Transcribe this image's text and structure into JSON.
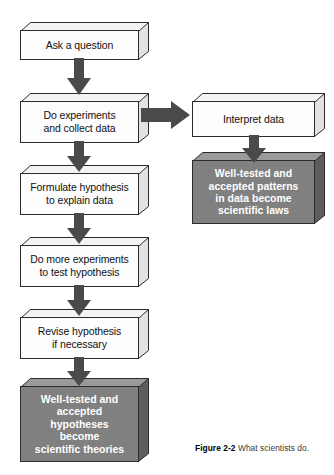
{
  "figure": {
    "caption_number": "Figure 2-2",
    "caption_text": "What scientists do.",
    "colors": {
      "box_fill": "#fdfdfd",
      "box_stroke": "#2b2b2b",
      "conclusion_fill": "#808080",
      "conclusion_top": "#9a9a9a",
      "conclusion_side": "#5e5e5e",
      "arrow_fill": "#4a4a4a",
      "text": "#111111",
      "conclusion_text": "#ffffff"
    }
  },
  "nodes": {
    "ask_question": {
      "lines": [
        "Ask a question"
      ],
      "type": "process"
    },
    "do_experiments": {
      "lines": [
        "Do experiments",
        "and collect data"
      ],
      "type": "process"
    },
    "interpret_data": {
      "lines": [
        "Interpret data"
      ],
      "type": "process"
    },
    "scientific_laws": {
      "lines": [
        "Well-tested and",
        "accepted patterns",
        "in data become"
      ],
      "emphasis": "scientific laws",
      "type": "conclusion"
    },
    "formulate_hypothesis": {
      "lines": [
        "Formulate hypothesis",
        "to explain data"
      ],
      "type": "process"
    },
    "more_experiments": {
      "lines": [
        "Do more experiments",
        "to test hypothesis"
      ],
      "type": "process"
    },
    "revise_hypothesis": {
      "lines": [
        "Revise hypothesis",
        "if necessary"
      ],
      "type": "process"
    },
    "scientific_theories": {
      "lines": [
        "Well-tested and",
        "accepted",
        "hypotheses",
        "become"
      ],
      "emphasis": "scientific theories",
      "type": "conclusion"
    }
  },
  "arrows": [
    {
      "name": "ask-to-experiments",
      "direction": "down"
    },
    {
      "name": "experiments-to-interpret",
      "direction": "right"
    },
    {
      "name": "experiments-to-formulate",
      "direction": "down"
    },
    {
      "name": "interpret-to-laws",
      "direction": "down"
    },
    {
      "name": "formulate-to-more-experiments",
      "direction": "down"
    },
    {
      "name": "more-experiments-to-revise",
      "direction": "down"
    },
    {
      "name": "revise-to-theories",
      "direction": "down"
    }
  ]
}
